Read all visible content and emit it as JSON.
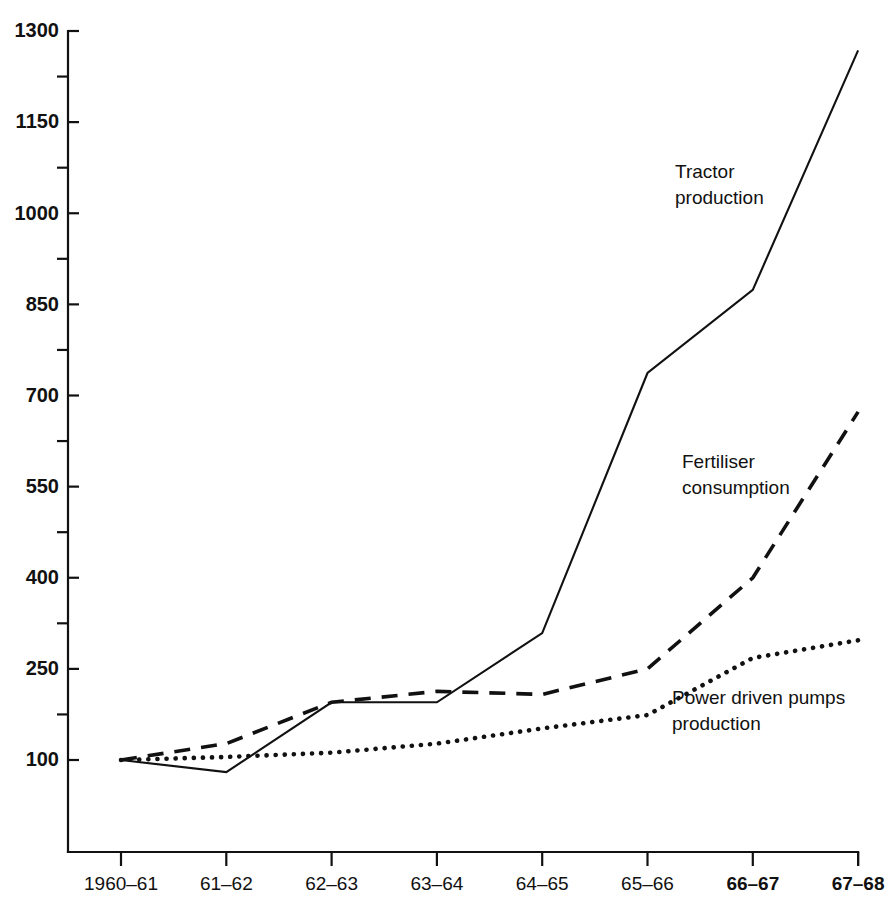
{
  "chart_data": {
    "type": "line",
    "title": "",
    "xlabel": "",
    "ylabel": "",
    "categories": [
      "1960–61",
      "61–62",
      "62–63",
      "63–64",
      "64–65",
      "65–66",
      "66–67",
      "67–68"
    ],
    "ylim": [
      0,
      1300
    ],
    "yticks": [
      100,
      250,
      400,
      550,
      700,
      850,
      1000,
      1150,
      1300
    ],
    "ytick_labels": [
      "100",
      "250",
      "400",
      "550",
      "700",
      "850",
      "1000",
      "1150",
      "1300"
    ],
    "minor_ticks": [
      175,
      325,
      475,
      625,
      775,
      925,
      1075,
      1225
    ],
    "grid": false,
    "legend_position": "inline-annotations",
    "series": [
      {
        "name": "Tractor production",
        "style": "solid",
        "label_lines": [
          "Tractor",
          "production"
        ],
        "values": [
          100,
          80,
          195,
          195,
          309,
          737,
          874,
          1268
        ]
      },
      {
        "name": "Fertiliser consumption",
        "style": "dashed",
        "label_lines": [
          "Fertiliser",
          "consumption"
        ],
        "values": [
          100,
          127,
          195,
          213,
          208,
          250,
          400,
          673
        ]
      },
      {
        "name": "Power driven pumps production",
        "style": "dotted",
        "label_lines": [
          "Power driven pumps",
          "production"
        ],
        "values": [
          100,
          105,
          112,
          127,
          152,
          174,
          268,
          297
        ]
      }
    ],
    "bold_categories": [
      "66–67",
      "67–68"
    ],
    "colors": {
      "ink": "#111111",
      "background": "#ffffff"
    }
  }
}
